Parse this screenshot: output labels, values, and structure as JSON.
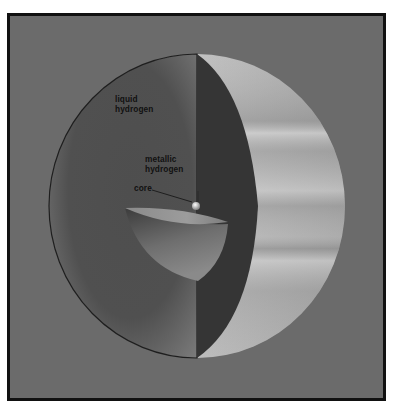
{
  "diagram": {
    "colors": {
      "background": "#6b6b6b",
      "frame_border": "#111111",
      "interior_cut": "#4a4a4a",
      "cut_face_dark": "#333333",
      "outer_surface_light": "#b8b8b8",
      "label_text": "#111111"
    },
    "labels": {
      "liquid_hydrogen_line1": "liquid",
      "liquid_hydrogen_line2": "hydrogen",
      "metallic_hydrogen_line1": "metallic",
      "metallic_hydrogen_line2": "hydrogen",
      "core": "core"
    },
    "layers": [
      "liquid hydrogen",
      "metallic hydrogen",
      "core"
    ]
  }
}
